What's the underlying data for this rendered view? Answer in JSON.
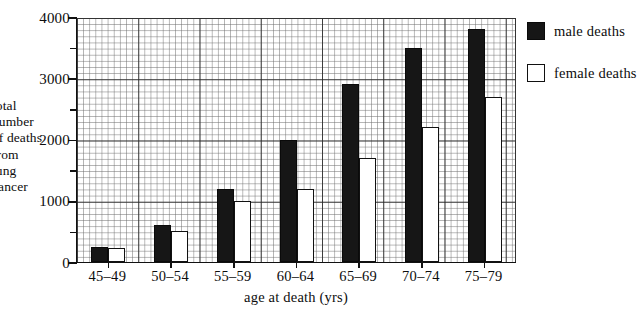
{
  "chart_data": {
    "type": "bar",
    "title": "",
    "subtitle": "",
    "xlabel": "age at death (yrs)",
    "ylabel": "total number of deaths from lung cancer",
    "ylabel_lines": [
      "total",
      "number",
      "of deaths",
      "from",
      "lung",
      "cancer"
    ],
    "categories": [
      "45–49",
      "50–54",
      "55–59",
      "60–64",
      "65–69",
      "70–74",
      "75–79"
    ],
    "series": [
      {
        "name": "male deaths",
        "color": "#161616",
        "values": [
          250,
          600,
          1200,
          2000,
          2900,
          3500,
          3800
        ]
      },
      {
        "name": "female deaths",
        "color": "#ffffff",
        "values": [
          230,
          500,
          1000,
          1200,
          1700,
          2200,
          2700
        ]
      }
    ],
    "ylim": [
      0,
      4000
    ],
    "yticks": [
      0,
      1000,
      2000,
      3000,
      4000
    ],
    "ytick_labels": [
      "0",
      "1000",
      "2000",
      "3000",
      "4000"
    ],
    "y_minor_step": 100,
    "y_major_step": 500,
    "grid": true,
    "legend_position": "right",
    "legend": [
      "male deaths",
      "female deaths"
    ]
  },
  "legend": {
    "male_label": "male deaths",
    "female_label": "female deaths"
  },
  "axes": {
    "x_title": "age at death (yrs)"
  }
}
